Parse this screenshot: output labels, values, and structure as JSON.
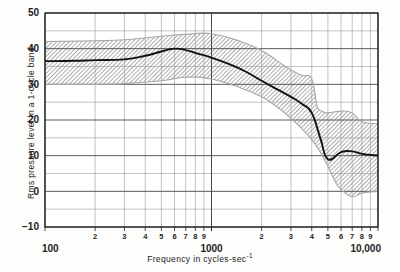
{
  "chart_data": {
    "type": "line",
    "title": "",
    "xlabel": "Frequency in cycles-sec-1",
    "ylabel": "Rms pressure level in a 1-cycle band",
    "xscale": "log",
    "yscale": "linear",
    "xlim": [
      100,
      10000
    ],
    "ylim": [
      -10,
      50
    ],
    "grid": true,
    "legend": "none",
    "y_major_ticks": [
      -10,
      0,
      10,
      20,
      30,
      40,
      50
    ],
    "y_minor_step": 5,
    "x_decade_labels": [
      {
        "value": 100,
        "label": "100"
      },
      {
        "value": 1000,
        "label": "1000"
      },
      {
        "value": 10000,
        "label": "10,000"
      }
    ],
    "x_minor_labels": [
      {
        "value": 200,
        "label": "2"
      },
      {
        "value": 300,
        "label": "3"
      },
      {
        "value": 400,
        "label": "4"
      },
      {
        "value": 500,
        "label": "5"
      },
      {
        "value": 600,
        "label": "6"
      },
      {
        "value": 700,
        "label": "7"
      },
      {
        "value": 800,
        "label": "8"
      },
      {
        "value": 900,
        "label": "9"
      },
      {
        "value": 2000,
        "label": "2"
      },
      {
        "value": 3000,
        "label": "3"
      },
      {
        "value": 4000,
        "label": "4"
      },
      {
        "value": 5000,
        "label": "5"
      },
      {
        "value": 6000,
        "label": "6"
      },
      {
        "value": 7000,
        "label": "7"
      },
      {
        "value": 8000,
        "label": "8"
      },
      {
        "value": 9000,
        "label": "9"
      }
    ],
    "series": [
      {
        "name": "Mean rms pressure level",
        "style": "solid-line",
        "color": "#111111",
        "x": [
          100,
          150,
          200,
          300,
          400,
          500,
          600,
          700,
          800,
          1000,
          1300,
          1600,
          2000,
          2500,
          3000,
          3500,
          4000,
          4500,
          5000,
          6000,
          7000,
          8000,
          10000
        ],
        "y": [
          36.5,
          36.6,
          36.8,
          37.0,
          38.0,
          39.2,
          40.0,
          39.6,
          38.8,
          37.5,
          35.5,
          33.6,
          31.0,
          28.5,
          26.5,
          24.5,
          22.0,
          15.0,
          9.0,
          11.0,
          11.2,
          10.5,
          10.0
        ]
      },
      {
        "name": "Spread band upper bound",
        "style": "hatched-band-edge",
        "color": "#8c8c8c",
        "x": [
          100,
          200,
          300,
          500,
          700,
          1000,
          1500,
          2000,
          2500,
          3000,
          3500,
          4000,
          4300,
          4600,
          5000,
          6000,
          7000,
          8000,
          10000
        ],
        "y": [
          42.0,
          42.2,
          42.5,
          43.5,
          44.0,
          44.2,
          42.0,
          39.5,
          36.5,
          34.0,
          32.5,
          31.5,
          24.0,
          22.5,
          22.0,
          22.5,
          22.0,
          19.5,
          19.0
        ]
      },
      {
        "name": "Spread band lower bound",
        "style": "hatched-band-edge",
        "color": "#8c8c8c",
        "x": [
          100,
          200,
          300,
          500,
          700,
          1000,
          1500,
          2000,
          2500,
          3000,
          3500,
          4000,
          4500,
          5000,
          5500,
          6000,
          7000,
          8000,
          10000
        ],
        "y": [
          30.0,
          30.0,
          30.2,
          31.0,
          32.0,
          31.5,
          29.0,
          26.5,
          23.5,
          20.5,
          17.5,
          14.5,
          11.0,
          7.0,
          3.0,
          0.5,
          -1.5,
          -0.5,
          0.0
        ]
      }
    ],
    "annotations": []
  },
  "figure": {
    "x_axis_title_main": "Frequency in cycles-sec",
    "x_axis_title_exponent": "-1",
    "y_axis_title": "Rms pressure level in a 1-cycle band"
  },
  "colors": {
    "background": "#fdfdfb",
    "grid_major": "#4a4a4a",
    "grid_minor": "#9a9a9a",
    "axis": "#1a1a1a",
    "curve": "#111111",
    "band_fill": "#9c9c9c",
    "text": "#232323"
  }
}
